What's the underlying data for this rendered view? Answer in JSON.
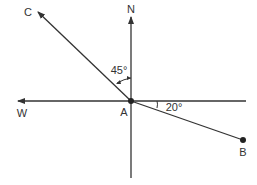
{
  "diagram": {
    "type": "compass-bearing",
    "colors": {
      "line": "#333333",
      "background": "#ffffff"
    },
    "directions": {
      "north": "N",
      "west": "W"
    },
    "points": {
      "origin": "A",
      "end": "B",
      "ray": "C"
    },
    "angles": {
      "nc": {
        "label": "45°",
        "degrees": 45,
        "between": "N and AC"
      },
      "eb": {
        "label": "20°",
        "degrees": 20,
        "between": "East axis and AB"
      }
    }
  }
}
